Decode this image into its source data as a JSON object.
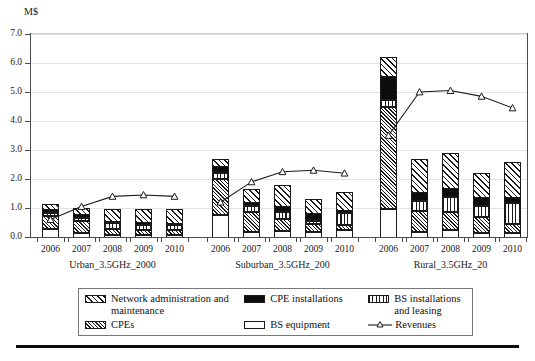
{
  "chart_data": {
    "type": "bar",
    "subtype": "stacked-bar-with-line-overlay",
    "title": "",
    "xlabel": "",
    "ylabel": "M$",
    "ylim": [
      0.0,
      7.0
    ],
    "ytick_labels": [
      "0.0",
      "1.0",
      "2.0",
      "3.0",
      "4.0",
      "5.0",
      "6.0",
      "7.0"
    ],
    "ytick_values": [
      0.0,
      1.0,
      2.0,
      3.0,
      4.0,
      5.0,
      6.0,
      7.0
    ],
    "grid": true,
    "legend_position": "below-axes",
    "categories": [
      "2006",
      "2007",
      "2008",
      "2009",
      "2010"
    ],
    "groups": [
      {
        "name": "Urban_3.5GHz_2000",
        "series": [
          {
            "name": "BS equipment",
            "values": [
              0.3,
              0.18,
              0.12,
              0.1,
              0.1
            ]
          },
          {
            "name": "CPEs",
            "values": [
              0.45,
              0.42,
              0.2,
              0.18,
              0.18
            ]
          },
          {
            "name": "BS installations and leasing",
            "values": [
              0.12,
              0.1,
              0.18,
              0.18,
              0.18
            ]
          },
          {
            "name": "CPE installations",
            "values": [
              0.13,
              0.12,
              0.08,
              0.1,
              0.07
            ]
          },
          {
            "name": "Network administration and maintenance",
            "values": [
              0.15,
              0.18,
              0.37,
              0.39,
              0.42
            ]
          }
        ],
        "totals": [
          1.15,
          1.0,
          0.95,
          0.95,
          0.95
        ],
        "revenues": [
          0.6,
          1.05,
          1.4,
          1.45,
          1.4
        ]
      },
      {
        "name": "Suburban_3.5GHz_200",
        "series": [
          {
            "name": "BS equipment",
            "values": [
              0.8,
              0.22,
              0.25,
              0.22,
              0.28
            ]
          },
          {
            "name": "CPEs",
            "values": [
              1.22,
              0.68,
              0.42,
              0.28,
              0.16
            ]
          },
          {
            "name": "BS installations and leasing",
            "values": [
              0.22,
              0.2,
              0.22,
              0.1,
              0.42
            ]
          },
          {
            "name": "CPE installations",
            "values": [
              0.26,
              0.15,
              0.22,
              0.25,
              0.12
            ]
          },
          {
            "name": "Network administration and maintenance",
            "values": [
              0.2,
              0.4,
              0.69,
              0.45,
              0.57
            ]
          }
        ],
        "totals": [
          2.7,
          1.65,
          1.8,
          1.3,
          1.55
        ],
        "revenues": [
          1.2,
          1.9,
          2.25,
          2.3,
          2.2
        ]
      },
      {
        "name": "Rural_3.5GHz_20",
        "series": [
          {
            "name": "BS equipment",
            "values": [
              1.0,
              0.22,
              0.28,
              0.18,
              0.18
            ]
          },
          {
            "name": "CPEs",
            "values": [
              3.5,
              0.72,
              0.62,
              0.55,
              0.3
            ]
          },
          {
            "name": "BS installations and leasing",
            "values": [
              0.25,
              0.35,
              0.52,
              0.36,
              0.72
            ]
          },
          {
            "name": "CPE installations",
            "values": [
              0.85,
              0.3,
              0.32,
              0.34,
              0.22
            ]
          },
          {
            "name": "Network administration and maintenance",
            "values": [
              0.6,
              1.11,
              1.16,
              0.77,
              1.18
            ]
          }
        ],
        "totals": [
          6.2,
          2.7,
          2.9,
          2.2,
          2.8
        ],
        "revenues": [
          3.5,
          5.0,
          5.05,
          4.85,
          4.45
        ]
      }
    ],
    "legend_entries": [
      {
        "key": "netadmin",
        "label": "Network administration and maintenance",
        "pattern": "diagonal-hatch-wide"
      },
      {
        "key": "cpeinst",
        "label": "CPE installations",
        "pattern": "solid-black"
      },
      {
        "key": "bsinst",
        "label": "BS installations and leasing",
        "pattern": "vertical-lines"
      },
      {
        "key": "cpes",
        "label": "CPEs",
        "pattern": "diagonal-hatch-dense"
      },
      {
        "key": "bseq",
        "label": "BS equipment",
        "pattern": "solid-white"
      },
      {
        "key": "revenues",
        "label": "Revenues",
        "pattern": "line-with-triangle-marker"
      }
    ],
    "colors": {
      "ink": "#1a1a1a",
      "grid": "#e3e3e3",
      "axis": "#4a4a4a",
      "fill_white": "#ffffff",
      "fill_black": "#0d0d0d"
    }
  },
  "legend": {
    "netadmin_label": "Network administration and maintenance",
    "cpeinst_label": "CPE installations",
    "bsinst_label": "BS installations and leasing",
    "cpes_label": "CPEs",
    "bseq_label": "BS equipment",
    "revenues_label": "Revenues"
  },
  "axis": {
    "unit_label": "M$"
  }
}
